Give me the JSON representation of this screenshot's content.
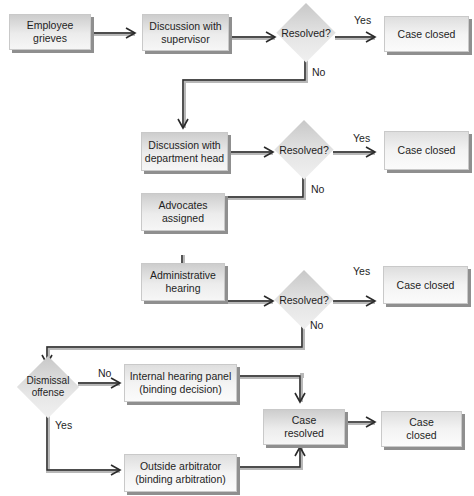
{
  "diagram": {
    "nodes": {
      "employee_grieves": "Employee\ngrieves",
      "discussion_supervisor": "Discussion with\nsupervisor",
      "resolved_1": "Resolved?",
      "case_closed_1": "Case closed",
      "discussion_dept_head": "Discussion with\ndepartment head",
      "resolved_2": "Resolved?",
      "case_closed_2": "Case closed",
      "advocates_assigned": "Advocates\nassigned",
      "administrative_hearing": "Administrative\nhearing",
      "resolved_3": "Resolved?",
      "case_closed_3": "Case closed",
      "dismissal_offense": "Dismissal\noffense",
      "internal_hearing_panel": "Internal hearing panel\n(binding decision)",
      "outside_arbitrator": "Outside arbitrator\n(binding arbitration)",
      "case_resolved": "Case\nresolved",
      "case_closed_final": "Case\nclosed"
    },
    "edge_labels": {
      "yes_1": "Yes",
      "no_1": "No",
      "yes_2": "Yes",
      "no_2": "No",
      "yes_3": "Yes",
      "no_3": "No",
      "no_dismissal": "No",
      "yes_dismissal": "Yes"
    },
    "edges": [
      {
        "from": "employee_grieves",
        "to": "discussion_supervisor"
      },
      {
        "from": "discussion_supervisor",
        "to": "resolved_1"
      },
      {
        "from": "resolved_1",
        "to": "case_closed_1",
        "label": "Yes"
      },
      {
        "from": "resolved_1",
        "to": "discussion_dept_head",
        "label": "No"
      },
      {
        "from": "discussion_dept_head",
        "to": "resolved_2"
      },
      {
        "from": "resolved_2",
        "to": "case_closed_2",
        "label": "Yes"
      },
      {
        "from": "resolved_2",
        "to": "advocates_assigned",
        "label": "No"
      },
      {
        "from": "advocates_assigned",
        "to": "administrative_hearing"
      },
      {
        "from": "administrative_hearing",
        "to": "resolved_3"
      },
      {
        "from": "resolved_3",
        "to": "case_closed_3",
        "label": "Yes"
      },
      {
        "from": "resolved_3",
        "to": "dismissal_offense",
        "label": "No"
      },
      {
        "from": "dismissal_offense",
        "to": "internal_hearing_panel",
        "label": "No"
      },
      {
        "from": "dismissal_offense",
        "to": "outside_arbitrator",
        "label": "Yes"
      },
      {
        "from": "internal_hearing_panel",
        "to": "case_resolved"
      },
      {
        "from": "outside_arbitrator",
        "to": "case_resolved"
      },
      {
        "from": "case_resolved",
        "to": "case_closed_final"
      }
    ]
  }
}
